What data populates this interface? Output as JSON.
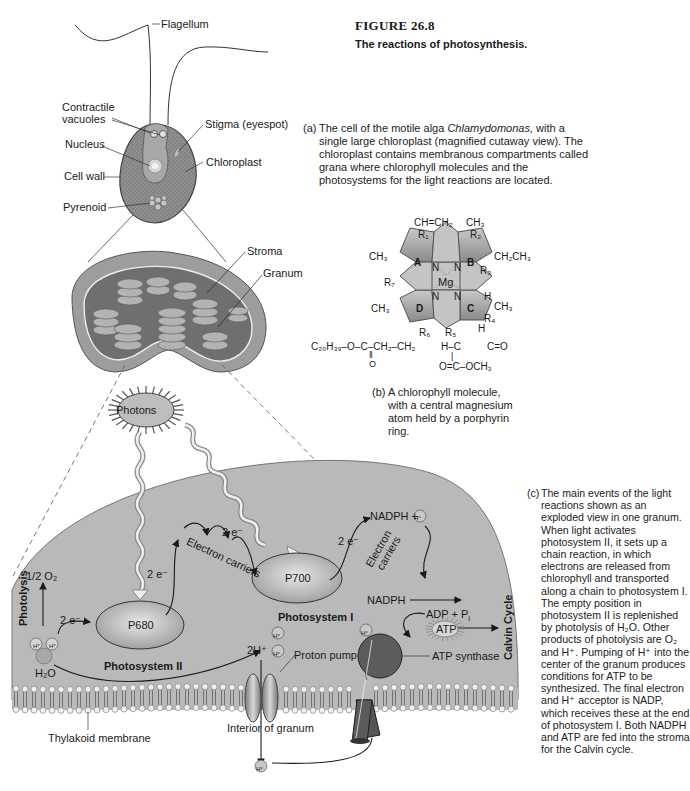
{
  "figure": {
    "number": "FIGURE 26.8",
    "title": "The reactions of photosynthesis."
  },
  "captions": {
    "a": {
      "tag": "(a)",
      "text_before": "The cell of the motile alga ",
      "italic": "Chlamydomonas,",
      "text_after": " with a single large chloroplast (magnified cutaway view). The chloroplast contains membranous compartments called grana where chlorophyll molecules and the photosystems for the light reactions are located."
    },
    "b": {
      "tag": "(b)",
      "text": "A chlorophyll molecule, with a central magnesium atom held by a porphyrin ring."
    },
    "c": {
      "tag": "(c)",
      "text": "The main events of the light reactions shown as an exploded view in one granum. When light activates photosystem II, it sets up a chain reaction, in which electrons are released from chlorophyll and transported along a chain to photosystem I. The empty position in photosystem II is replenished by photolysis of H₂O. Other products of photolysis are O₂ and H⁺. Pumping of H⁺ into the center of the granum produces conditions for ATP to be synthesized. The final electron and H⁺ acceptor is NADP, which receives these at the end of photosystem I. Both NADPH and ATP are fed into the stroma for the Calvin cycle."
    }
  },
  "cell_labels": {
    "flagellum": "Flagellum",
    "contractile_vacuoles": "Contractile vacuoles",
    "contractile_line1": "Contractile",
    "contractile_line2": "vacuoles",
    "nucleus": "Nucleus",
    "cell_wall": "Cell wall",
    "pyrenoid": "Pyrenoid",
    "stigma": "Stigma (eyespot)",
    "chloroplast": "Chloroplast"
  },
  "chloroplast_labels": {
    "stroma": "Stroma",
    "granum": "Granum"
  },
  "chlorophyll": {
    "center": "Mg",
    "rings": [
      "A",
      "B",
      "C",
      "D"
    ],
    "nitrogen": "N",
    "substituents": {
      "top_left": "CH=CH₂",
      "top_right": "CH₃",
      "r1": "R₁",
      "r2": "R₂",
      "r3": "R₃",
      "r4": "R₄",
      "r5": "R₅",
      "r6": "R₆",
      "r7": "R₇",
      "left_a": "CH₃",
      "right_b": "CH₂CH₃",
      "left_d": "CH₃",
      "right_c": "CH₃",
      "h_c1": "H",
      "h_c2": "H",
      "tail": "C₂₀H₃₉–O–C–CH₂–CH₂",
      "tail_carbonyl_o": "O",
      "tail_double": "‖",
      "ester_top": "H–C",
      "ester_ketone": "C=O",
      "ester_bottom": "O=C–OCH₃",
      "ester_bar": "|"
    }
  },
  "light_reactions": {
    "photons": "Photons",
    "photolysis": "Photolysis",
    "half_o2": "1/2 O₂",
    "two_e": "2 e⁻",
    "h_plus": "H⁺",
    "h2o": "H₂O",
    "p680": "P680",
    "photosystem_ii": "Photosystem II",
    "electron_carriers": "Electron carriers",
    "electron_carriers_l1": "Electron",
    "electron_carriers_l2": "carriers",
    "p700": "P700",
    "photosystem_i": "Photosystem I",
    "nadph_h": "NADPH + ",
    "nadph": "NADPH",
    "adp_pi": "ADP + P",
    "pi_sub": "i",
    "atp": "ATP",
    "calvin_cycle": "Calvin Cycle",
    "two_h_plus": "2H⁺",
    "proton_pump": "Proton pump",
    "atp_synthase": "ATP synthase",
    "interior_of_granum": "Interior of granum",
    "thylakoid_membrane": "Thylakoid membrane"
  },
  "colors": {
    "granum_fill": "#b9b9b9",
    "cell_fill": "#8f8f8f",
    "porphyrin_fill": "#bdbdbd",
    "membrane_head": "#eeeeee",
    "synthase": "#555555",
    "text": "#1a1a1a"
  }
}
